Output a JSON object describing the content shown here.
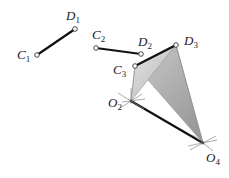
{
  "diagram": {
    "colors": {
      "link": "#111111",
      "coupler_fill_light": "#d8d8d8",
      "coupler_fill_dark": "#a8a8a8",
      "pivot_marks": "#888888",
      "background": "#ffffff"
    },
    "points": {
      "C1": {
        "x": 37,
        "y": 55,
        "label": "C",
        "sub": "1"
      },
      "D1": {
        "x": 75,
        "y": 29,
        "label": "D",
        "sub": "1"
      },
      "C2": {
        "x": 96,
        "y": 48,
        "label": "C",
        "sub": "2"
      },
      "D2": {
        "x": 141,
        "y": 54,
        "label": "D",
        "sub": "2"
      },
      "C3": {
        "x": 135,
        "y": 66,
        "label": "C",
        "sub": "3"
      },
      "D3": {
        "x": 176,
        "y": 45,
        "label": "D",
        "sub": "3"
      },
      "O2": {
        "x": 131,
        "y": 101,
        "label": "O",
        "sub": "2"
      },
      "O4": {
        "x": 203,
        "y": 143,
        "label": "O",
        "sub": "4"
      }
    },
    "segments": [
      {
        "name": "C1-D1",
        "from": "C1",
        "to": "D1"
      },
      {
        "name": "C2-D2",
        "from": "C2",
        "to": "D2"
      },
      {
        "name": "C3-D3",
        "from": "C3",
        "to": "D3"
      },
      {
        "name": "O2-O4",
        "from": "O2",
        "to": "O4"
      }
    ],
    "labels": [
      {
        "id": "C1",
        "text": "C",
        "sub": "1",
        "x": 17,
        "y": 59
      },
      {
        "id": "D1",
        "text": "D",
        "sub": "1",
        "x": 66,
        "y": 20
      },
      {
        "id": "C2",
        "text": "C",
        "sub": "2",
        "x": 92,
        "y": 39
      },
      {
        "id": "D2",
        "text": "D",
        "sub": "2",
        "x": 138,
        "y": 46
      },
      {
        "id": "D3",
        "text": "D",
        "sub": "3",
        "x": 184,
        "y": 45
      },
      {
        "id": "C3",
        "text": "C",
        "sub": "3",
        "x": 113,
        "y": 74
      },
      {
        "id": "O2",
        "text": "O",
        "sub": "2",
        "x": 108,
        "y": 107
      },
      {
        "id": "O4",
        "text": "O",
        "sub": "4",
        "x": 206,
        "y": 162
      }
    ]
  }
}
